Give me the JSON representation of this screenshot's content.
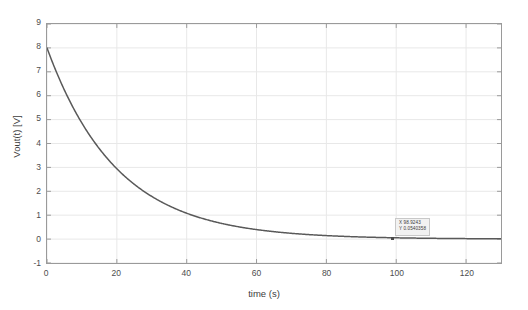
{
  "chart_data": {
    "type": "line",
    "title": "",
    "xlabel": "time (s)",
    "ylabel": "Vout(t) [V]",
    "xlim": [
      0,
      130
    ],
    "ylim": [
      -1,
      9
    ],
    "xticks": [
      0,
      20,
      40,
      60,
      80,
      100,
      120
    ],
    "yticks": [
      -1,
      0,
      1,
      2,
      3,
      4,
      5,
      6,
      7,
      8,
      9
    ],
    "grid": true,
    "legend": null,
    "series": [
      {
        "name": "Vout(t)",
        "color": "#595959",
        "equation": "8*exp(-t/20)",
        "amplitude": 8,
        "tau": 20,
        "x": [
          0,
          2,
          4,
          6,
          8,
          10,
          12,
          14,
          16,
          18,
          20,
          24,
          28,
          32,
          36,
          40,
          44,
          48,
          52,
          56,
          60,
          65,
          70,
          75,
          80,
          85,
          90,
          95,
          100,
          105,
          110,
          115,
          120,
          125,
          130
        ],
        "y": [
          8.0,
          7.239,
          6.551,
          5.928,
          5.363,
          4.853,
          4.391,
          3.974,
          3.595,
          3.254,
          2.943,
          2.41,
          1.973,
          1.615,
          1.323,
          1.083,
          0.886,
          0.726,
          0.594,
          0.487,
          0.398,
          0.311,
          0.243,
          0.189,
          0.147,
          0.115,
          0.089,
          0.07,
          0.054,
          0.042,
          0.033,
          0.026,
          0.02,
          0.015,
          0.012
        ]
      }
    ],
    "annotations": [
      {
        "name": "data-tip",
        "x": 98.9243,
        "y": 0.0540358,
        "x_label": "X 98.9243",
        "y_label": "Y 0.0540358"
      }
    ]
  },
  "axes": {
    "xlabel": "time (s)",
    "ylabel": "Vout(t) [V]",
    "xtick_labels": [
      "0",
      "20",
      "40",
      "60",
      "80",
      "100",
      "120"
    ],
    "ytick_labels": [
      "-1",
      "0",
      "1",
      "2",
      "3",
      "4",
      "5",
      "6",
      "7",
      "8",
      "9"
    ]
  },
  "datatip": {
    "line1": "X 98.9243",
    "line2": "Y 0.0540358"
  },
  "colors": {
    "curve": "#595959",
    "grid": "#e8e8e8",
    "axis": "#9a9a9a",
    "tick_text": "#4d4d4d",
    "background": "#ffffff",
    "tip_background": "#f2f2f2",
    "tip_border": "#c8c8c8"
  }
}
